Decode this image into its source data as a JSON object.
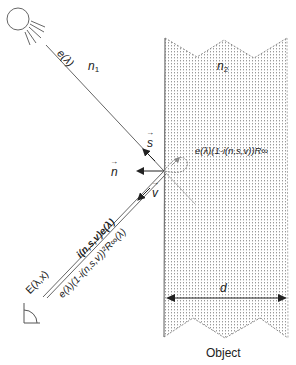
{
  "diagram": {
    "colors": {
      "line": "#555555",
      "object_fill_dots": "#9a9a9a",
      "object_border": "#8a8a8a",
      "text": "#222222"
    },
    "labels": {
      "incident_light": "e(λ)",
      "medium_1": "n",
      "medium_1_sub": "1",
      "medium_2": "n",
      "medium_2_sub": "2",
      "vector_s": "s",
      "vector_n": "n",
      "vector_v": "v",
      "internal_scatter": "e(λ)(1-i(n,s,v))R∞",
      "surface_reflection": "i(n,s,v)e(λ)",
      "body_reflection": "e(λ)(1-i(n,s,v))²R∞(λ)",
      "observed_radiance": "E(λ,x)",
      "thickness": "d",
      "object_caption": "Object"
    },
    "icons": {
      "light_source": "sun-icon",
      "observer": "camera-angle-icon"
    }
  }
}
